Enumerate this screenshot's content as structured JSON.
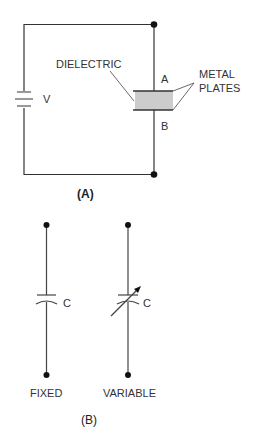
{
  "figure_a": {
    "caption": "(A)",
    "labels": {
      "dielectric": "DIELECTRIC",
      "plate_a": "A",
      "plate_b": "B",
      "metal_plates_1": "METAL",
      "metal_plates_2": "PLATES",
      "voltage": "V"
    },
    "colors": {
      "dielectric_fill": "#cccccc",
      "wire": "#333333"
    }
  },
  "figure_b": {
    "caption": "(B)",
    "fixed": {
      "symbol_label": "C",
      "name": "FIXED"
    },
    "variable": {
      "symbol_label": "C",
      "name": "VARIABLE"
    }
  }
}
